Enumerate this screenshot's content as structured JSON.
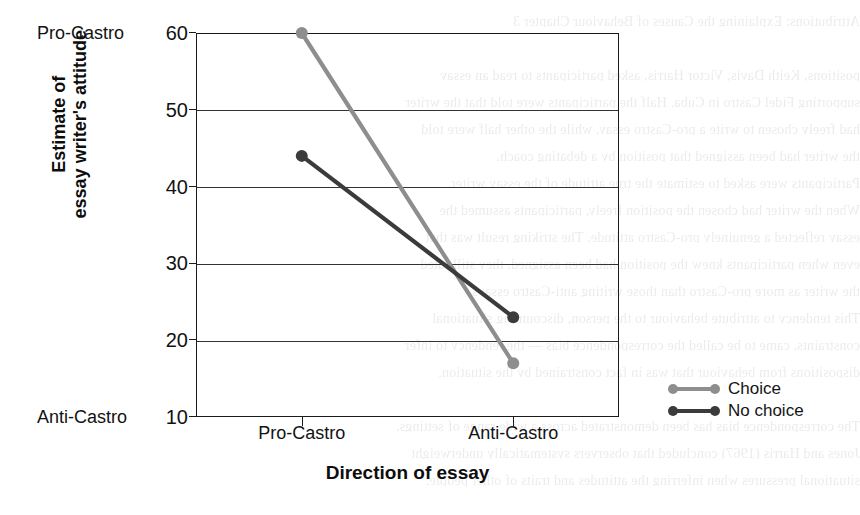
{
  "chart_data": {
    "type": "line",
    "title": "",
    "xlabel": "Direction of essay",
    "ylabel": "Estimate of essay writer's attitude",
    "ylabel_line1": "Estimate of",
    "ylabel_line2": "essay writer's attitude",
    "categories": [
      "Pro-Castro",
      "Anti-Castro"
    ],
    "yticks": [
      60,
      50,
      40,
      30,
      20,
      10
    ],
    "ylim": [
      10,
      60
    ],
    "ytick_labels": [
      "60",
      "50",
      "40",
      "30",
      "20",
      "10"
    ],
    "y_anchor_high": "Pro-Castro",
    "y_anchor_low": "Anti-Castro",
    "grid": true,
    "legend_position": "right",
    "series": [
      {
        "name": "Choice",
        "color": "#8e8e8e",
        "values": [
          60,
          17
        ]
      },
      {
        "name": "No choice",
        "color": "#3b3b3b",
        "values": [
          44,
          23
        ]
      }
    ]
  },
  "legend": {
    "items": [
      {
        "label": "Choice",
        "color": "#8e8e8e"
      },
      {
        "label": "No choice",
        "color": "#3b3b3b"
      }
    ]
  },
  "background_text": {
    "lines": [
      "Attributions: Explaining the Causes of Behaviour  Chapter 3",
      "",
      "positions, Keith Davis, Victor Harris, asked participants to read an essay",
      "supporting Fidel Castro in Cuba. Half the participants were told that the writer",
      "had freely chosen to write a pro-Castro essay, while the other half were told",
      "the writer had been assigned that position by a debating coach.",
      "Participants were asked to estimate the true attitude of the essay writer.",
      "When the writer had chosen the position freely, participants assumed the",
      "essay reflected a genuinely pro-Castro attitude. The striking result was that",
      "even when participants knew the position had been assigned, they still rated",
      "the writer as more pro-Castro than those writing anti-Castro essays.",
      "This tendency to attribute behaviour to the person, discounting situational",
      "constraints, came to be called the correspondence bias — the tendency to infer",
      "dispositions from behaviour that was in fact constrained by the situation.",
      "",
      "The correspondence bias has been demonstrated across a wide range of settings.",
      "Jones and Harris (1967) concluded that observers systematically underweight",
      "situational pressures when inferring the attitudes and traits of other people."
    ]
  }
}
